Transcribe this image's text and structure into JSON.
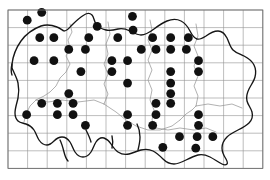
{
  "figure": {
    "kind": "distribution-dot-map",
    "title": "",
    "caption": "",
    "background_color": "#ffffff"
  },
  "grid": {
    "color": "#8c8c8c",
    "border_color": "#7a7a7a",
    "line_width": 0.6,
    "x0": 8,
    "y0": 10,
    "cell_w": 19.6,
    "cell_h": 17.6,
    "cols": 13,
    "rows": 9
  },
  "outline": {
    "coast_color": "#1a1a1a",
    "coast_width": 1.3,
    "internal_color": "#808080",
    "internal_width": 0.7
  },
  "symbol": {
    "name": "filled-circle",
    "color": "#111111",
    "radius": 4.4,
    "label": "presence record"
  },
  "chart_data": {
    "type": "scatter",
    "xlabel": "",
    "ylabel": "",
    "xlim": [
      0,
      13
    ],
    "ylim": [
      0,
      9
    ],
    "grid": true,
    "legend": "none",
    "series": [
      {
        "name": "presence",
        "marker": "filled-circle",
        "color": "#111111",
        "count": 63,
        "points": [
          [
            1.72,
            0.13
          ],
          [
            0.98,
            0.58
          ],
          [
            4.55,
            0.93
          ],
          [
            6.35,
            0.36
          ],
          [
            6.38,
            1.14
          ],
          [
            1.62,
            1.57
          ],
          [
            2.34,
            1.57
          ],
          [
            4.12,
            1.57
          ],
          [
            5.6,
            1.57
          ],
          [
            7.38,
            1.57
          ],
          [
            8.3,
            1.57
          ],
          [
            9.2,
            1.57
          ],
          [
            3.1,
            2.24
          ],
          [
            3.95,
            2.24
          ],
          [
            6.8,
            2.24
          ],
          [
            7.55,
            2.24
          ],
          [
            8.3,
            2.24
          ],
          [
            9.1,
            2.24
          ],
          [
            1.33,
            2.88
          ],
          [
            2.34,
            2.88
          ],
          [
            5.3,
            2.88
          ],
          [
            6.1,
            2.88
          ],
          [
            9.72,
            2.88
          ],
          [
            3.72,
            3.5
          ],
          [
            5.3,
            3.5
          ],
          [
            8.3,
            3.5
          ],
          [
            9.72,
            3.5
          ],
          [
            6.1,
            4.15
          ],
          [
            8.3,
            4.15
          ],
          [
            3.1,
            4.75
          ],
          [
            8.3,
            4.75
          ],
          [
            1.72,
            5.3
          ],
          [
            2.52,
            5.3
          ],
          [
            3.32,
            5.3
          ],
          [
            7.55,
            5.3
          ],
          [
            8.3,
            5.3
          ],
          [
            0.95,
            5.95
          ],
          [
            2.52,
            5.95
          ],
          [
            3.32,
            5.95
          ],
          [
            6.1,
            5.95
          ],
          [
            7.55,
            5.95
          ],
          [
            9.72,
            5.95
          ],
          [
            3.95,
            6.55
          ],
          [
            6.1,
            6.55
          ],
          [
            7.38,
            6.55
          ],
          [
            9.72,
            6.55
          ],
          [
            8.75,
            7.2
          ],
          [
            9.65,
            7.2
          ],
          [
            10.45,
            7.2
          ],
          [
            7.9,
            7.8
          ],
          [
            9.58,
            7.85
          ]
        ]
      }
    ]
  },
  "a11y": {
    "figure_role": "Dot distribution map with grid overlay",
    "description": "Black filled circles indicate presence in grid squares over an administrative outline map."
  }
}
